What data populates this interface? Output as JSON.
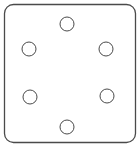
{
  "diagram": {
    "colors": {
      "stroke": "#4a4a4a",
      "background": "#ffffff"
    },
    "plate": {
      "x": 4.5,
      "y": 4.5,
      "width": 131,
      "height": 138,
      "rx": 9
    },
    "holes": [
      {
        "id": "top",
        "cx": 67,
        "cy": 24,
        "r": 7
      },
      {
        "id": "upper-left",
        "cx": 29,
        "cy": 49,
        "r": 7
      },
      {
        "id": "upper-right",
        "cx": 106,
        "cy": 49,
        "r": 7
      },
      {
        "id": "lower-left",
        "cx": 30,
        "cy": 97,
        "r": 7
      },
      {
        "id": "lower-right",
        "cx": 107,
        "cy": 96,
        "r": 7
      },
      {
        "id": "bottom",
        "cx": 67,
        "cy": 127,
        "r": 7
      }
    ]
  }
}
